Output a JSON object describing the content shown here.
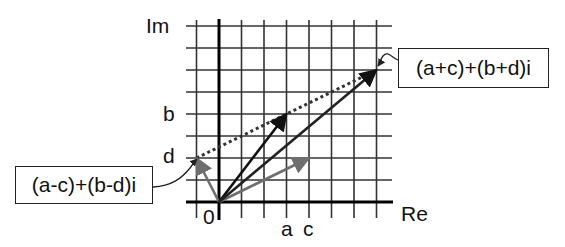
{
  "diagram": {
    "axes": {
      "imag_label": "Im",
      "real_label": "Re",
      "origin_label": "0"
    },
    "tick_labels": {
      "x": [
        {
          "label": "a",
          "value": 3
        },
        {
          "label": "c",
          "value": 4
        }
      ],
      "y": [
        {
          "label": "b",
          "value": 4
        },
        {
          "label": "d",
          "value": 2
        }
      ]
    },
    "grid": {
      "x_min": -1,
      "x_max": 7,
      "y_min": 0,
      "y_max": 8
    },
    "points": {
      "z1": {
        "x": 3,
        "y": 4,
        "name": "a+bi",
        "color": "#111111"
      },
      "z2": {
        "x": 4,
        "y": 2,
        "name": "c+di",
        "color": "#6e6e6e"
      },
      "sum": {
        "x": 7,
        "y": 6,
        "name": "(a+c)+(b+d)i",
        "color": "#222222"
      },
      "diff": {
        "x": -1,
        "y": 2,
        "name": "(a-c)+(b-d)i",
        "color": "#6e6e6e"
      }
    },
    "callouts": {
      "sum_label": "(a+c)+(b+d)i",
      "diff_label": "(a-c)+(b-d)i"
    },
    "dotted_line_color": "#333333"
  }
}
